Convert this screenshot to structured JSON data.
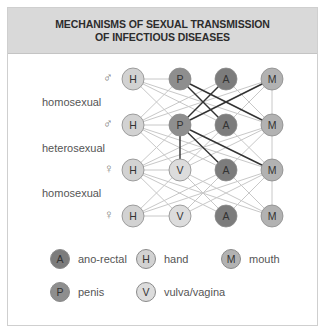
{
  "title": {
    "line1": "MECHANISMS OF SEXUAL TRANSMISSION",
    "line2": "OF INFECTIOUS DISEASES"
  },
  "rows": [
    {
      "symbol": "♂",
      "nodes": [
        "H",
        "P",
        "A",
        "M"
      ]
    },
    {
      "symbol": "♂",
      "nodes": [
        "H",
        "P",
        "A",
        "M"
      ]
    },
    {
      "symbol": "♀",
      "nodes": [
        "H",
        "V",
        "A",
        "M"
      ]
    },
    {
      "symbol": "♀",
      "nodes": [
        "H",
        "V",
        "A",
        "M"
      ]
    }
  ],
  "row_labels": [
    "homosexual",
    "heterosexual",
    "homosexual"
  ],
  "colors": {
    "A": "#7c7c7c",
    "P": "#8e8e8e",
    "M": "#b2b2b2",
    "H": "#d2d2d2",
    "V": "#dcdcdc",
    "light_edge": "#c8c8c8",
    "dark_edge": "#333333"
  },
  "legend": [
    {
      "letter": "A",
      "label": "ano-rectal"
    },
    {
      "letter": "H",
      "label": "hand"
    },
    {
      "letter": "M",
      "label": "mouth"
    },
    {
      "letter": "P",
      "label": "penis"
    },
    {
      "letter": "V",
      "label": "vulva/vagina"
    }
  ]
}
